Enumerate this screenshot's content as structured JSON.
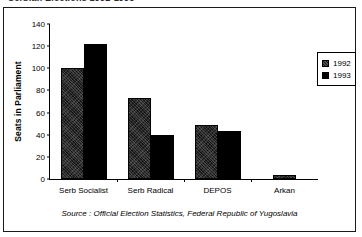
{
  "title_clipped": "Serbian Elections 1992-1993",
  "source_note": "Source : Official Election Statistics, Federal Republic of Yugoslavia",
  "legend": {
    "position": "right",
    "entries": [
      {
        "label": "1992",
        "swatch": "dark-hatched-swatch"
      },
      {
        "label": "1993",
        "swatch": "solid-black-swatch"
      }
    ]
  },
  "chart_data": {
    "type": "bar",
    "title": "Serbian Elections 1992-1993",
    "xlabel": "",
    "ylabel": "Seats in Parliament",
    "categories": [
      "Serb Socialist",
      "Serb Radical",
      "DEPOS",
      "Arkan"
    ],
    "series": [
      {
        "name": "1992",
        "values": [
          100,
          73,
          49,
          4
        ]
      },
      {
        "name": "1993",
        "values": [
          122,
          40,
          43,
          0
        ]
      }
    ],
    "ylim": [
      0,
      140
    ],
    "yticks": [
      0,
      20,
      40,
      60,
      80,
      100,
      120,
      140
    ],
    "grid": false,
    "legend_position": "right",
    "annotations": [
      "Source : Official Election Statistics, Federal Republic of Yugoslavia"
    ]
  }
}
